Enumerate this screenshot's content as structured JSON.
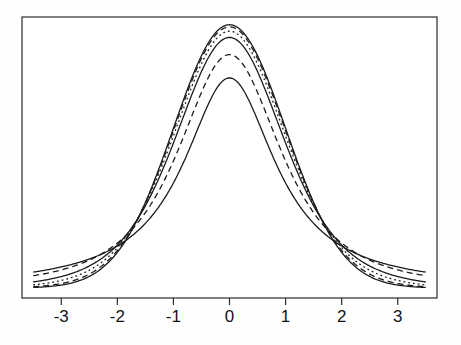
{
  "figure": {
    "background": "#fefefe",
    "plot_background": "#ffffff",
    "border_color": "#2b2b2b",
    "curve_color": "#1c1c1c"
  },
  "chart_data": {
    "type": "line",
    "title": "",
    "subtitle": "",
    "xlabel": "",
    "ylabel": "",
    "legend": "none",
    "grid": false,
    "x_range": [
      -3.5,
      3.5
    ],
    "x_axis_usr_range": [
      -3.7,
      3.7
    ],
    "x_ticks": [
      -3,
      -2,
      -1,
      0,
      1,
      2,
      3
    ],
    "y_range": [
      0,
      0.42
    ],
    "y_ticks": [],
    "series": [
      {
        "name": "normal",
        "distribution": "normal",
        "df": null,
        "peak_density": 0.3989,
        "tail_density_at_3_5": 0.0009,
        "line_style": "solid"
      },
      {
        "name": "t-df-30",
        "distribution": "t",
        "df": 30,
        "peak_density": 0.3956,
        "tail_density_at_3_5": 0.002,
        "line_style": "dashed"
      },
      {
        "name": "t-df-10",
        "distribution": "t",
        "df": 10,
        "peak_density": 0.3891,
        "tail_density_at_3_5": 0.0048,
        "line_style": "dotted"
      },
      {
        "name": "t-df-5",
        "distribution": "t",
        "df": 5,
        "peak_density": 0.3796,
        "tail_density_at_3_5": 0.0092,
        "line_style": "solid"
      },
      {
        "name": "t-df-2",
        "distribution": "t",
        "df": 2,
        "peak_density": 0.3536,
        "tail_density_at_3_5": 0.0186,
        "line_style": "dashed"
      },
      {
        "name": "t-df-1",
        "distribution": "t",
        "df": 1,
        "peak_density": 0.3183,
        "tail_density_at_3_5": 0.024,
        "line_style": "solid"
      }
    ]
  }
}
